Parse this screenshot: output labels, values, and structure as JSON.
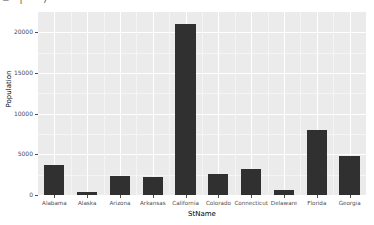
{
  "top_strip": {
    "fragment": "=—|  ·   ·· )"
  },
  "chart_data": {
    "type": "bar",
    "title": "",
    "xlabel": "StName",
    "ylabel": "Population",
    "categories": [
      "Alabama",
      "Alaska",
      "Arizona",
      "Arkansas",
      "California",
      "Colorado",
      "Connecticut",
      "Delaware",
      "Florida",
      "Georgia"
    ],
    "values": [
      3700,
      400,
      2300,
      2200,
      21000,
      2600,
      3200,
      600,
      8000,
      4800
    ],
    "ylim": [
      0,
      22500
    ],
    "yticks": [
      0,
      5000,
      10000,
      15000,
      20000
    ],
    "ytick_labels": [
      "0",
      "5000",
      "10000",
      "15000",
      "20000"
    ],
    "grid": true,
    "legend": "none",
    "bar_color": "#303030",
    "panel_color": "#ebebeb",
    "grid_color": "#ffffff",
    "axis_text_color": "#4d4d4d"
  }
}
